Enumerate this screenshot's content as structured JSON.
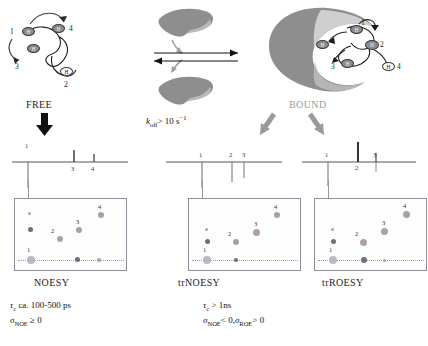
{
  "figure": {
    "free_label": "FREE",
    "bound_label": "BOUND",
    "exchange_label_k": "k",
    "exchange_label_sub": "off",
    "exchange_label_rest": "> 10 s",
    "exchange_label_sup": "−1"
  },
  "free_state": {
    "protons": [
      {
        "id": "h1",
        "type": "filled",
        "glyph": "H"
      },
      {
        "id": "h2",
        "type": "filled",
        "glyph": "H"
      },
      {
        "id": "h3",
        "type": "filled",
        "glyph": "H"
      },
      {
        "id": "h4",
        "type": "open",
        "glyph": "H"
      }
    ],
    "numbers": [
      "1",
      "3",
      "4",
      "2"
    ]
  },
  "bound_state": {
    "protons": [
      {
        "id": "h1",
        "type": "filled",
        "glyph": "H"
      },
      {
        "id": "h2",
        "type": "filled",
        "glyph": "H"
      },
      {
        "id": "h3",
        "type": "filled",
        "glyph": "H"
      },
      {
        "id": "h4",
        "type": "open",
        "glyph": "H"
      }
    ],
    "numbers": [
      "1",
      "2",
      "3",
      "4"
    ]
  },
  "panels": [
    {
      "name": "noesy",
      "caption": "NOESY",
      "trace_peaks": [
        {
          "label": "1",
          "direction": "down",
          "height": 26
        },
        {
          "label": "3",
          "direction": "up",
          "height": 11
        },
        {
          "label": "4",
          "direction": "up",
          "height": 7
        }
      ],
      "cross_peaks": [
        {
          "label": "4",
          "sign": "positive"
        },
        {
          "label": "3",
          "sign": "positive"
        },
        {
          "label": "2",
          "sign": "positive"
        },
        {
          "label": "1",
          "sign": "diagonal"
        }
      ]
    },
    {
      "name": "trnoesy",
      "caption": "trNOESY",
      "trace_peaks": [
        {
          "label": "1",
          "direction": "down",
          "height": 26
        },
        {
          "label": "2",
          "direction": "down",
          "height": 16
        },
        {
          "label": "3",
          "direction": "down",
          "height": 12
        }
      ],
      "cross_peaks": [
        {
          "label": "4",
          "sign": "negative"
        },
        {
          "label": "3",
          "sign": "negative"
        },
        {
          "label": "2",
          "sign": "negative"
        },
        {
          "label": "1",
          "sign": "diagonal"
        }
      ]
    },
    {
      "name": "trroesy",
      "caption": "trROESY",
      "trace_peaks": [
        {
          "label": "1",
          "direction": "down",
          "height": 24
        },
        {
          "label": "2",
          "direction": "up",
          "height": 20
        },
        {
          "label": "3",
          "direction": "up",
          "height": 9
        }
      ],
      "cross_peaks": [
        {
          "label": "4",
          "sign": "positive"
        },
        {
          "label": "3",
          "sign": "positive"
        },
        {
          "label": "2",
          "sign": "positive"
        },
        {
          "label": "1",
          "sign": "diagonal"
        }
      ]
    }
  ],
  "annotations": {
    "free_tau_prefix": "τ",
    "free_tau_sub": "c",
    "free_tau_value": "ca. 100-500 ps",
    "free_sigma": "σ",
    "free_sigma_sub": "NOE",
    "free_sigma_value": "≥ 0",
    "bound_tau_prefix": "τ",
    "bound_tau_sub": "c",
    "bound_tau_value": "> 1ns",
    "bound_sigma1": "σ",
    "bound_sigma1_sub": "NOE",
    "bound_sigma1_value": "< 0,",
    "bound_sigma2": "σ",
    "bound_sigma2_sub": "ROE",
    "bound_sigma2_value": "> 0"
  },
  "colors": {
    "protein_gray": "#8e8e8e",
    "protein_light": "#c9c9c9",
    "peak_color": "#a89aa6",
    "bound_text": "#9a9a9a",
    "panel_border": "#8e8e9a"
  }
}
